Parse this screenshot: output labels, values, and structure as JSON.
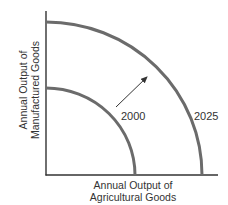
{
  "diagram": {
    "type": "production-possibilities-frontier",
    "x_axis_label_line1": "Annual Output of",
    "x_axis_label_line2": "Agricultural Goods",
    "y_axis_label_line1": "Annual Output of",
    "y_axis_label_line2": "Manufactured Goods",
    "curves": [
      {
        "label": "2000",
        "color": "#6b6b6b"
      },
      {
        "label": "2025",
        "color": "#6b6b6b"
      }
    ],
    "arrow_direction": "outward",
    "axis_color": "#333333"
  }
}
